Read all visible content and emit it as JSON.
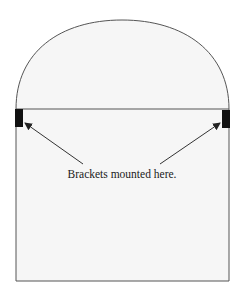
{
  "diagram": {
    "label": "Brackets mounted here.",
    "colors": {
      "background": "#ffffff",
      "fill": "#f6f6f6",
      "outline": "#555555",
      "bracket": "#111111",
      "arrow": "#333333",
      "text": "#1a1a1a"
    },
    "brackets": [
      {
        "side": "left"
      },
      {
        "side": "right"
      }
    ]
  }
}
